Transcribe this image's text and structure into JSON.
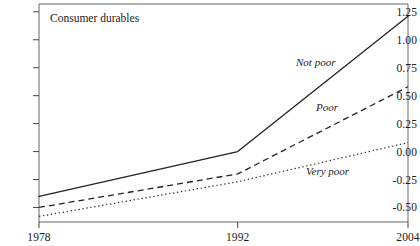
{
  "panel": {
    "title": "Consumer durables"
  },
  "axes": {
    "y_ticks": [
      "1.25",
      "1.00",
      "0.75",
      "0.50",
      "0.25",
      "0.00",
      "-0.25",
      "-0.50"
    ],
    "x_ticks": [
      "1978",
      "1992",
      "2004"
    ]
  },
  "series_labels": {
    "not_poor": "Not poor",
    "poor": "Poor",
    "very_poor": "Very poor"
  },
  "colors": {
    "line": "#222222",
    "frame": "#555555",
    "background": "#ffffff"
  },
  "chart_data": {
    "type": "line",
    "title": "Consumer durables",
    "xlabel": "",
    "ylabel": "",
    "x": [
      1978,
      1992,
      2004
    ],
    "xlim": [
      1978,
      2004
    ],
    "ylim": [
      -0.63,
      1.32
    ],
    "ytick_values": [
      1.25,
      1.0,
      0.75,
      0.5,
      0.25,
      0.0,
      -0.25,
      -0.5
    ],
    "xtick_values": [
      1978,
      1992,
      2004
    ],
    "grid": false,
    "legend": "inline-annotations",
    "series": [
      {
        "name": "Not poor",
        "style": "solid",
        "values": [
          -0.4,
          0.0,
          1.21
        ]
      },
      {
        "name": "Poor",
        "style": "dashed",
        "values": [
          -0.5,
          -0.2,
          0.58
        ]
      },
      {
        "name": "Very poor",
        "style": "dotted",
        "values": [
          -0.58,
          -0.27,
          0.08
        ]
      }
    ]
  }
}
